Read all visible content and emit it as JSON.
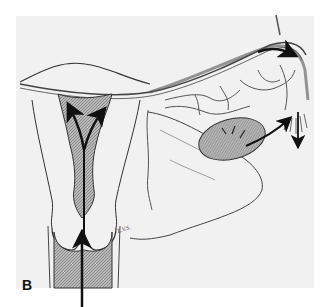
{
  "figure": {
    "panel_label": "B",
    "artist_signature": "L.V.S.",
    "colors": {
      "background": "#f1f1f1",
      "ink": "#222222",
      "hatch_fill": "#9a9a9a",
      "arrow": "#111111"
    },
    "parts": [
      "uterine cavity",
      "cervical canal",
      "vagina",
      "fallopian tube",
      "ovary",
      "fimbriae",
      "broad ligament",
      "vessels"
    ],
    "arrows": [
      {
        "name": "vaginal-ascending-arrow",
        "direction": "up"
      },
      {
        "name": "uterine-left-arrow",
        "direction": "up-left"
      },
      {
        "name": "uterine-right-arrow",
        "direction": "up-right"
      },
      {
        "name": "tubal-arrow",
        "direction": "right"
      },
      {
        "name": "ovary-arrow",
        "direction": "right"
      },
      {
        "name": "fimbrial-descending-arrow",
        "direction": "down"
      }
    ]
  }
}
